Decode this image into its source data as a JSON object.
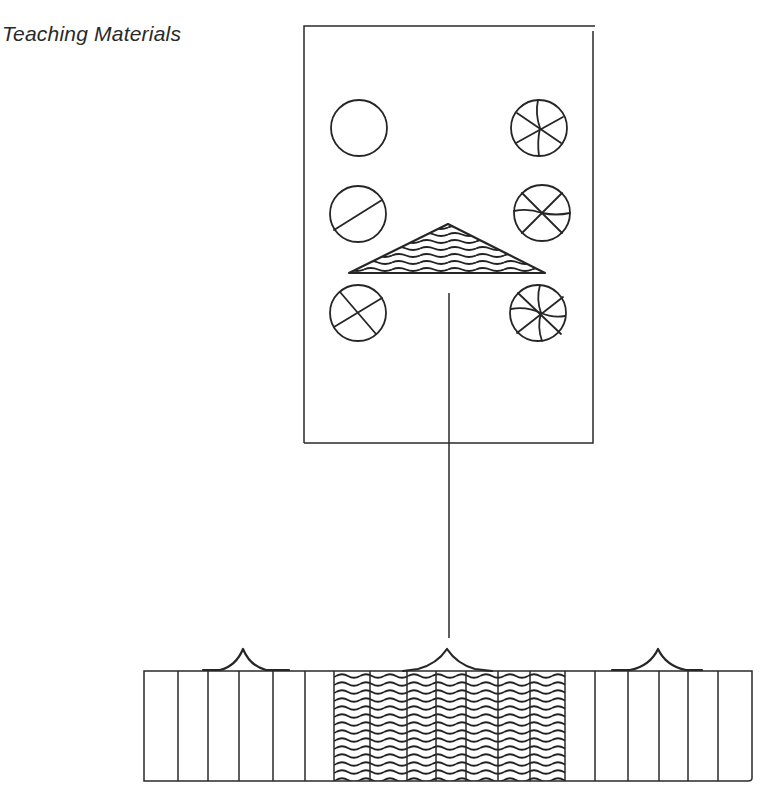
{
  "page": {
    "title": "Teaching Materials"
  },
  "card": {
    "description": "Rectangular card with six divided circles and a wavy-hatched triangle",
    "circles": [
      {
        "position": "left-1",
        "divisions": 0,
        "label": "whole"
      },
      {
        "position": "left-2",
        "divisions": 2,
        "label": "halves"
      },
      {
        "position": "left-3",
        "divisions": 4,
        "label": "quarters"
      },
      {
        "position": "right-1",
        "divisions": 6,
        "label": "sixths"
      },
      {
        "position": "right-2",
        "divisions": 6,
        "label": "sixths-alt"
      },
      {
        "position": "right-3",
        "divisions": 8,
        "label": "eighths"
      }
    ],
    "triangle": {
      "fill_pattern": "wavy-lines"
    }
  },
  "strip": {
    "description": "Strip of vertical panels with three peaked bumps; middle section wavy hatched",
    "left_panels": 6,
    "hatched_panels": 7,
    "right_panels": 6,
    "bumps": 3
  },
  "colors": {
    "ink": "#262626",
    "background": "#ffffff"
  }
}
